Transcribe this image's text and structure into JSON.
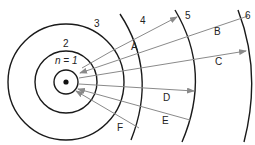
{
  "diagram": {
    "nucleus": {
      "label": "nucleus"
    },
    "levels": [
      {
        "n": "n = 1",
        "label": "n = 1"
      },
      {
        "n": "2",
        "label": "2"
      },
      {
        "n": "3",
        "label": "3"
      },
      {
        "n": "4",
        "label": "4"
      },
      {
        "n": "5",
        "label": "5"
      },
      {
        "n": "6",
        "label": "6"
      }
    ],
    "transitions": [
      {
        "label": "A",
        "from": "1",
        "to": "5",
        "direction": "outward"
      },
      {
        "label": "B",
        "from": "6",
        "to": "1",
        "direction": "inward"
      },
      {
        "label": "C",
        "from": "1",
        "to": "6",
        "direction": "outward"
      },
      {
        "label": "D",
        "from": "1",
        "to": "5",
        "direction": "outward"
      },
      {
        "label": "E",
        "from": "5",
        "to": "1",
        "direction": "inward"
      },
      {
        "label": "F",
        "from": "4",
        "to": "1",
        "direction": "inward"
      }
    ],
    "colors": {
      "orbit": "#1a1a1a",
      "arrow": "#8a8a8a",
      "text": "#222222"
    }
  }
}
